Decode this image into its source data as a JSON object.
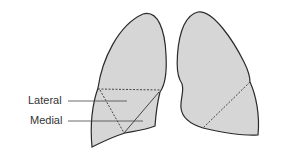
{
  "diagram": {
    "labels": [
      {
        "id": "lateral",
        "text": "Lateral"
      },
      {
        "id": "medial",
        "text": "Medial"
      }
    ],
    "colors": {
      "lung_fill": "#d6d6d6",
      "outline": "#2a2a2a",
      "leader_line": "#444444",
      "label_text": "#333333"
    }
  }
}
